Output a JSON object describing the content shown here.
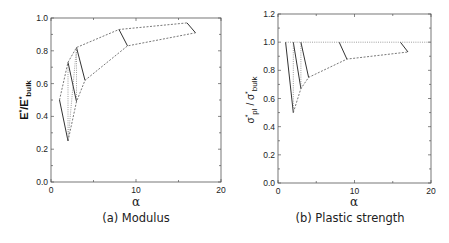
{
  "chart_data": [
    {
      "type": "line",
      "caption": "(a) Modulus",
      "xlabel": "α",
      "ylabel": "E*/E*bulk",
      "xlim": [
        0,
        20
      ],
      "ylim": [
        0,
        1.0
      ],
      "xticks": [
        "0",
        "10",
        "20"
      ],
      "yticks": [
        "0.0",
        "0.2",
        "0.4",
        "0.6",
        "0.8",
        "1.0"
      ],
      "grid": false,
      "series": [
        {
          "name": "solid segment 1",
          "style": "solid",
          "x": [
            1,
            2
          ],
          "y": [
            0.5,
            0.25
          ]
        },
        {
          "name": "solid segment 2",
          "style": "solid",
          "x": [
            2,
            3
          ],
          "y": [
            0.73,
            0.49
          ]
        },
        {
          "name": "solid segment 3",
          "style": "solid",
          "x": [
            3,
            4
          ],
          "y": [
            0.82,
            0.62
          ]
        },
        {
          "name": "solid segment 4",
          "style": "solid",
          "x": [
            8,
            9
          ],
          "y": [
            0.93,
            0.83
          ]
        },
        {
          "name": "solid segment 5",
          "style": "solid",
          "x": [
            16,
            17
          ],
          "y": [
            0.97,
            0.91
          ]
        },
        {
          "name": "upper envelope",
          "style": "dashed",
          "x": [
            1,
            2,
            3,
            8,
            16
          ],
          "y": [
            0.5,
            0.73,
            0.82,
            0.93,
            0.97
          ]
        },
        {
          "name": "lower envelope",
          "style": "dashed",
          "x": [
            2,
            3,
            4,
            9,
            17
          ],
          "y": [
            0.25,
            0.49,
            0.62,
            0.83,
            0.91
          ]
        },
        {
          "name": "connector 1",
          "style": "dotted",
          "x": [
            2,
            2
          ],
          "y": [
            0.25,
            0.73
          ]
        },
        {
          "name": "connector 2",
          "style": "dotted",
          "x": [
            2,
            3
          ],
          "y": [
            0.25,
            0.82
          ]
        },
        {
          "name": "connector 3",
          "style": "dotted",
          "x": [
            3,
            3
          ],
          "y": [
            0.49,
            0.82
          ]
        }
      ]
    },
    {
      "type": "line",
      "caption": "(b) Plastic strength",
      "xlabel": "α",
      "ylabel": "σ*pl / σ*bulk",
      "xlim": [
        0,
        20
      ],
      "ylim": [
        0,
        1.2
      ],
      "xticks": [
        "0",
        "10",
        "20"
      ],
      "yticks": [
        "0.0",
        "0.2",
        "0.4",
        "0.6",
        "0.8",
        "1.0",
        "1.2"
      ],
      "grid": false,
      "series": [
        {
          "name": "solid segment 1",
          "style": "solid",
          "x": [
            1,
            2
          ],
          "y": [
            1.0,
            0.5
          ]
        },
        {
          "name": "solid segment 2",
          "style": "solid",
          "x": [
            2,
            3
          ],
          "y": [
            1.0,
            0.67
          ]
        },
        {
          "name": "solid segment 3",
          "style": "solid",
          "x": [
            3,
            4
          ],
          "y": [
            1.0,
            0.75
          ]
        },
        {
          "name": "solid segment 4",
          "style": "solid",
          "x": [
            8,
            9
          ],
          "y": [
            1.0,
            0.88
          ]
        },
        {
          "name": "solid segment 5",
          "style": "solid",
          "x": [
            16,
            17
          ],
          "y": [
            1.0,
            0.93
          ]
        },
        {
          "name": "upper bound",
          "style": "dotted",
          "x": [
            1,
            20
          ],
          "y": [
            1.0,
            1.0
          ]
        },
        {
          "name": "lower envelope",
          "style": "dashed",
          "x": [
            2,
            3,
            4,
            9,
            17
          ],
          "y": [
            0.5,
            0.67,
            0.75,
            0.88,
            0.93
          ]
        },
        {
          "name": "connector 1",
          "style": "dotted",
          "x": [
            2,
            2
          ],
          "y": [
            0.5,
            1.0
          ]
        },
        {
          "name": "connector 2",
          "style": "dotted",
          "x": [
            3,
            3
          ],
          "y": [
            0.67,
            1.0
          ]
        }
      ]
    }
  ],
  "labels": {
    "a": {
      "caption": "(a) Modulus",
      "xlabel": "α",
      "ylabel_main": "E",
      "ylabel_star": "*",
      "ylabel_slash": "/E",
      "ylabel_star2": "*",
      "ylabel_sub": "bulk",
      "xticks": [
        "0",
        "10",
        "20"
      ],
      "yticks": [
        "0.0",
        "0.2",
        "0.4",
        "0.6",
        "0.8",
        "1.0"
      ]
    },
    "b": {
      "caption": "(b) Plastic strength",
      "xlabel": "α",
      "ylabel_sigma1": "σ",
      "ylabel_star": "*",
      "ylabel_sub1": "pl",
      "ylabel_slash": " / σ",
      "ylabel_star2": "*",
      "ylabel_sub2": "bulk",
      "xticks": [
        "0",
        "10",
        "20"
      ],
      "yticks": [
        "0.0",
        "0.2",
        "0.4",
        "0.6",
        "0.8",
        "1.0",
        "1.2"
      ]
    }
  }
}
